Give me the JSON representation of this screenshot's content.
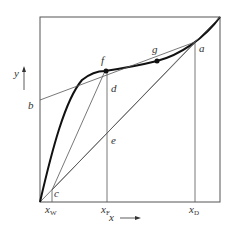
{
  "diagram": {
    "type": "McCabe-Thiele x-y diagram",
    "axis": {
      "x_label": "x",
      "y_label": "y"
    },
    "points": {
      "a": "a",
      "b": "b",
      "c": "c",
      "d": "d",
      "e": "e",
      "f": "f",
      "g": "g"
    },
    "ticks": {
      "xW": {
        "main": "x",
        "sub": "W"
      },
      "xF": {
        "main": "x",
        "sub": "F"
      },
      "xD": {
        "main": "x",
        "sub": "D"
      }
    },
    "colors": {
      "line": "#555555",
      "curve": "#111111",
      "text": "#333333"
    }
  }
}
